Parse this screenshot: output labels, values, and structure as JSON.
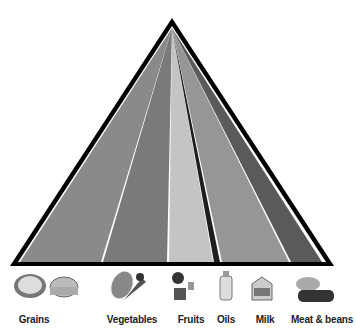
{
  "diagram": {
    "type": "food-pyramid",
    "apex": [
      172,
      20
    ],
    "base_y": 264,
    "groups": [
      {
        "name": "Grains",
        "label_x": 34,
        "color": "#8a8a8a",
        "base": [
          18,
          101
        ]
      },
      {
        "name": "Vegetables",
        "label_x": 132,
        "color": "#7a7a7a",
        "base": [
          103,
          167
        ]
      },
      {
        "name": "Fruits",
        "label_x": 191,
        "color": "#c2c2c2",
        "base": [
          169,
          213
        ]
      },
      {
        "name": "Oils",
        "label_x": 226,
        "color": "#222222",
        "base": [
          214,
          220
        ]
      },
      {
        "name": "Milk",
        "label_x": 265,
        "color": "#959595",
        "base": [
          222,
          289
        ]
      },
      {
        "name": "Meat & beans",
        "label_x": 322,
        "color": "#5c5c5c",
        "base": [
          291,
          322
        ]
      }
    ]
  }
}
